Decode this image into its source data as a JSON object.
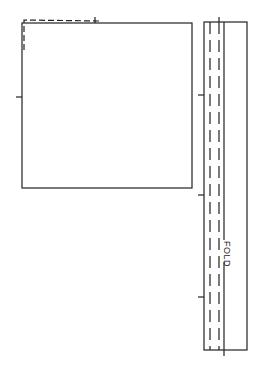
{
  "diagram": {
    "type": "pattern template",
    "colors": {
      "line": "#222222",
      "background": "#ffffff"
    },
    "square_panel": {
      "name": "square piece",
      "outline": {
        "x": 22,
        "y": 23,
        "width": 170,
        "height": 165
      },
      "seam_allowance_dashed": true,
      "tick_marks": [
        {
          "side": "left",
          "y": 97
        }
      ]
    },
    "strip_panel": {
      "name": "long strip",
      "outline": {
        "x": 204,
        "y": 22,
        "width": 43,
        "height": 328
      },
      "dashed_lines_x": [
        210,
        219
      ],
      "fold_line_x": 224,
      "fold_label": "FOLD",
      "tick_marks": [
        {
          "side": "left",
          "y": 95
        },
        {
          "side": "left",
          "y": 195
        },
        {
          "side": "left",
          "y": 297
        }
      ]
    }
  }
}
